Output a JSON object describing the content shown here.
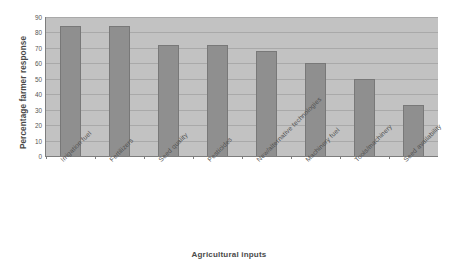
{
  "chart_data": {
    "type": "bar",
    "title": "",
    "xlabel": "Agricultural inputs",
    "ylabel": "Percentage farmer response",
    "ylim": [
      0,
      90
    ],
    "yticks": [
      0,
      10,
      20,
      30,
      40,
      50,
      60,
      70,
      80,
      90
    ],
    "grid": true,
    "legend": "none",
    "bar_color": "#8f8f8f",
    "plot_background": "#c2c2c2",
    "categories": [
      "Irrigation fuel",
      "Fertilizers",
      "Seed quality",
      "Pesticides",
      "New/alternative technologies",
      "Machinery fuel",
      "Tools/machinery",
      "Seed availability"
    ],
    "values": [
      84,
      84,
      72,
      72,
      68,
      60,
      50,
      33
    ]
  }
}
